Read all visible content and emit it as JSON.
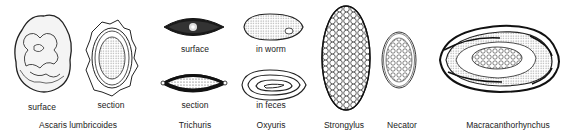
{
  "figure": {
    "specimens": [
      {
        "name": "Ascaris lumbricoides",
        "views": [
          "surface",
          "section"
        ]
      },
      {
        "name": "Trichuris",
        "views": [
          "surface",
          "section"
        ]
      },
      {
        "name": "Oxyuris",
        "views": [
          "in worm",
          "in feces"
        ]
      },
      {
        "name": "Strongylus",
        "views": []
      },
      {
        "name": "Necator",
        "views": []
      },
      {
        "name": "Macracanthorhynchus",
        "views": []
      }
    ]
  }
}
